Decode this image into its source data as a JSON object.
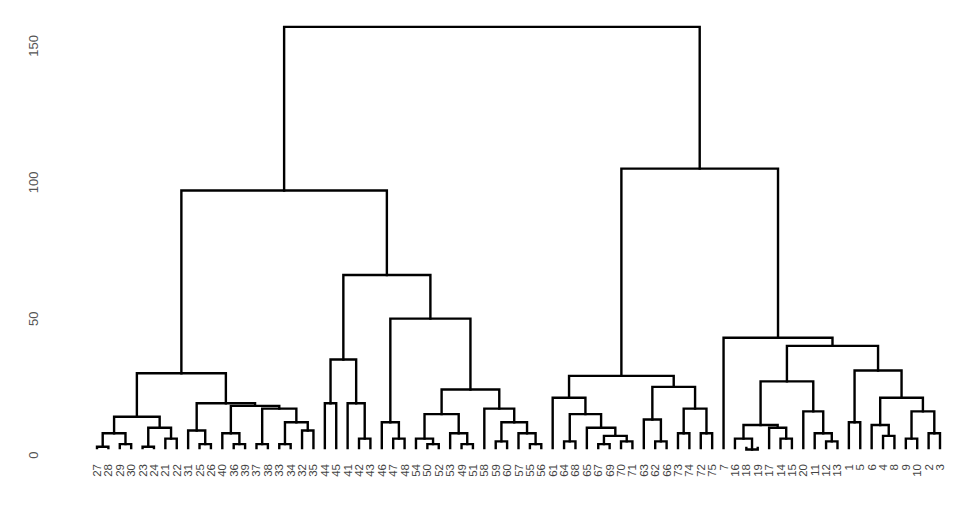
{
  "chart_data": {
    "type": "dendrogram",
    "title": "",
    "xlabel": "",
    "ylabel": "",
    "ylim": [
      0,
      160
    ],
    "yticks": [
      0,
      50,
      100,
      150
    ],
    "grid": false,
    "legend": null,
    "leaf_order": [
      "27",
      "28",
      "29",
      "30",
      "23",
      "24",
      "21",
      "22",
      "31",
      "25",
      "26",
      "40",
      "36",
      "39",
      "37",
      "38",
      "33",
      "34",
      "32",
      "35",
      "44",
      "45",
      "41",
      "42",
      "43",
      "46",
      "47",
      "48",
      "54",
      "50",
      "52",
      "53",
      "49",
      "51",
      "58",
      "59",
      "60",
      "57",
      "55",
      "56",
      "61",
      "64",
      "68",
      "65",
      "67",
      "69",
      "70",
      "71",
      "63",
      "62",
      "66",
      "73",
      "74",
      "72",
      "75",
      "7",
      "16",
      "18",
      "19",
      "17",
      "14",
      "15",
      "20",
      "11",
      "12",
      "13",
      "1",
      "5",
      "6",
      "4",
      "8",
      "9",
      "10",
      "2",
      "3"
    ],
    "tree": {
      "h": 157,
      "c": [
        {
          "h": 97,
          "c": [
            {
              "h": 30,
              "c": [
                {
                  "h": 14,
                  "c": [
                    {
                      "h": 8,
                      "c": [
                        {
                          "h": 3,
                          "c": [
                            "27",
                            "28"
                          ]
                        },
                        {
                          "h": 4,
                          "c": [
                            "29",
                            "30"
                          ]
                        }
                      ]
                    },
                    {
                      "h": 10,
                      "c": [
                        {
                          "h": 3,
                          "c": [
                            "23",
                            "24"
                          ]
                        },
                        {
                          "h": 6,
                          "c": [
                            "21",
                            "22"
                          ]
                        }
                      ]
                    }
                  ]
                },
                {
                  "h": 19,
                  "c": [
                    {
                      "h": 9,
                      "c": [
                        "31",
                        {
                          "h": 4,
                          "c": [
                            "25",
                            "26"
                          ]
                        }
                      ]
                    },
                    {
                      "h": 18,
                      "c": [
                        {
                          "h": 8,
                          "c": [
                            "40",
                            {
                              "h": 4,
                              "c": [
                                "36",
                                "39"
                              ]
                            }
                          ]
                        },
                        {
                          "h": 17,
                          "c": [
                            {
                              "h": 4,
                              "c": [
                                "37",
                                "38"
                              ]
                            },
                            {
                              "h": 12,
                              "c": [
                                {
                                  "h": 4,
                                  "c": [
                                    "33",
                                    "34"
                                  ]
                                },
                                {
                                  "h": 9,
                                  "c": [
                                    "32",
                                    "35"
                                  ]
                                }
                              ]
                            }
                          ]
                        }
                      ]
                    }
                  ]
                }
              ]
            },
            {
              "h": 66,
              "c": [
                {
                  "h": 35,
                  "c": [
                    {
                      "h": 19,
                      "c": [
                        "44",
                        "45"
                      ]
                    },
                    {
                      "h": 19,
                      "c": [
                        "41",
                        {
                          "h": 6,
                          "c": [
                            "42",
                            "43"
                          ]
                        }
                      ]
                    }
                  ]
                },
                {
                  "h": 50,
                  "c": [
                    {
                      "h": 12,
                      "c": [
                        "46",
                        {
                          "h": 6,
                          "c": [
                            "47",
                            "48"
                          ]
                        }
                      ]
                    },
                    {
                      "h": 24,
                      "c": [
                        {
                          "h": 15,
                          "c": [
                            {
                              "h": 6,
                              "c": [
                                "54",
                                {
                                  "h": 4,
                                  "c": [
                                    "50",
                                    "52"
                                  ]
                                }
                              ]
                            },
                            {
                              "h": 8,
                              "c": [
                                "53",
                                {
                                  "h": 4,
                                  "c": [
                                    "49",
                                    "51"
                                  ]
                                }
                              ]
                            }
                          ]
                        },
                        {
                          "h": 17,
                          "c": [
                            "58",
                            {
                              "h": 12,
                              "c": [
                                {
                                  "h": 5,
                                  "c": [
                                    "59",
                                    "60"
                                  ]
                                },
                                {
                                  "h": 8,
                                  "c": [
                                    "57",
                                    {
                                      "h": 4,
                                      "c": [
                                        "55",
                                        "56"
                                      ]
                                    }
                                  ]
                                }
                              ]
                            }
                          ]
                        }
                      ]
                    }
                  ]
                }
              ]
            }
          ]
        },
        {
          "h": 105,
          "c": [
            {
              "h": 29,
              "c": [
                {
                  "h": 21,
                  "c": [
                    "61",
                    {
                      "h": 15,
                      "c": [
                        {
                          "h": 5,
                          "c": [
                            "64",
                            "68"
                          ]
                        },
                        {
                          "h": 10,
                          "c": [
                            "65",
                            {
                              "h": 7,
                              "c": [
                                {
                                  "h": 4,
                                  "c": [
                                    "67",
                                    "69"
                                  ]
                                },
                                {
                                  "h": 5,
                                  "c": [
                                    "70",
                                    "71"
                                  ]
                                }
                              ]
                            }
                          ]
                        }
                      ]
                    }
                  ]
                },
                {
                  "h": 25,
                  "c": [
                    {
                      "h": 13,
                      "c": [
                        "63",
                        {
                          "h": 5,
                          "c": [
                            "62",
                            "66"
                          ]
                        }
                      ]
                    },
                    {
                      "h": 17,
                      "c": [
                        {
                          "h": 8,
                          "c": [
                            "73",
                            "74"
                          ]
                        },
                        {
                          "h": 8,
                          "c": [
                            "72",
                            "75"
                          ]
                        }
                      ]
                    }
                  ]
                }
              ]
            },
            {
              "h": 43,
              "c": [
                "7",
                {
                  "h": 40,
                  "c": [
                    {
                      "h": 27,
                      "c": [
                        {
                          "h": 11,
                          "c": [
                            {
                              "h": 6,
                              "c": [
                                "16",
                                {
                                  "h": 2,
                                  "c": [
                                    "18",
                                    "19"
                                  ]
                                }
                              ]
                            },
                            {
                              "h": 10,
                              "c": [
                                "17",
                                {
                                  "h": 6,
                                  "c": [
                                    "14",
                                    "15"
                                  ]
                                }
                              ]
                            }
                          ]
                        },
                        {
                          "h": 16,
                          "c": [
                            "20",
                            {
                              "h": 8,
                              "c": [
                                "11",
                                {
                                  "h": 5,
                                  "c": [
                                    "12",
                                    "13"
                                  ]
                                }
                              ]
                            }
                          ]
                        }
                      ]
                    },
                    {
                      "h": 31,
                      "c": [
                        {
                          "h": 12,
                          "c": [
                            "1",
                            "5"
                          ]
                        },
                        {
                          "h": 21,
                          "c": [
                            {
                              "h": 11,
                              "c": [
                                "6",
                                {
                                  "h": 7,
                                  "c": [
                                    "4",
                                    "8"
                                  ]
                                }
                              ]
                            },
                            {
                              "h": 16,
                              "c": [
                                {
                                  "h": 6,
                                  "c": [
                                    "9",
                                    "10"
                                  ]
                                },
                                {
                                  "h": 8,
                                  "c": [
                                    "2",
                                    "3"
                                  ]
                                }
                              ]
                            }
                          ]
                        }
                      ]
                    }
                  ]
                }
              ]
            }
          ]
        }
      ]
    }
  }
}
